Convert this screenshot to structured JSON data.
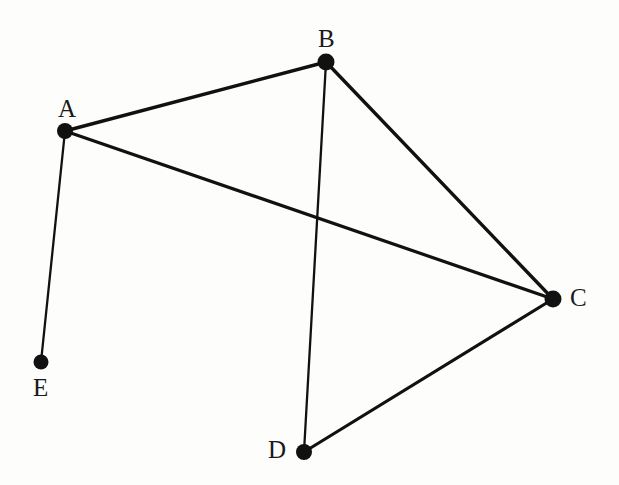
{
  "figure": {
    "type": "undirected-graph-diagram",
    "background_color": "#fdfdfc",
    "ink_color": "#111111",
    "width": 619,
    "height": 485
  },
  "graph": {
    "nodes": [
      {
        "id": "A",
        "label": "A",
        "x": 65,
        "y": 131,
        "r": 8,
        "label_x": 58,
        "label_y": 96
      },
      {
        "id": "B",
        "label": "B",
        "x": 326,
        "y": 62,
        "r": 8.5,
        "label_x": 318,
        "label_y": 26
      },
      {
        "id": "C",
        "label": "C",
        "x": 553,
        "y": 299,
        "r": 8.5,
        "label_x": 570,
        "label_y": 285
      },
      {
        "id": "D",
        "label": "D",
        "x": 304,
        "y": 452,
        "r": 8,
        "label_x": 268,
        "label_y": 437
      },
      {
        "id": "E",
        "label": "E",
        "x": 41,
        "y": 362,
        "r": 7.5,
        "label_x": 33,
        "label_y": 375
      }
    ],
    "edges": [
      {
        "id": "A-B",
        "from": "A",
        "to": "B",
        "width": 3.4
      },
      {
        "id": "A-C",
        "from": "A",
        "to": "C",
        "width": 3.2
      },
      {
        "id": "A-E",
        "from": "A",
        "to": "E",
        "width": 2.3
      },
      {
        "id": "B-C",
        "from": "B",
        "to": "C",
        "width": 3.4
      },
      {
        "id": "B-D",
        "from": "B",
        "to": "D",
        "width": 2.3
      },
      {
        "id": "C-D",
        "from": "C",
        "to": "D",
        "width": 3.2
      }
    ],
    "node_count": 5,
    "edge_count": 6
  },
  "chart_data": {
    "type": "diagram",
    "title": "",
    "categories": [
      "A",
      "B",
      "C",
      "D",
      "E"
    ],
    "series": [
      {
        "name": "degree",
        "values": [
          3,
          3,
          3,
          2,
          1
        ]
      }
    ],
    "adjacency": {
      "A": [
        "B",
        "C",
        "E"
      ],
      "B": [
        "A",
        "C",
        "D"
      ],
      "C": [
        "A",
        "B",
        "D"
      ],
      "D": [
        "B",
        "C"
      ],
      "E": [
        "A"
      ]
    }
  }
}
